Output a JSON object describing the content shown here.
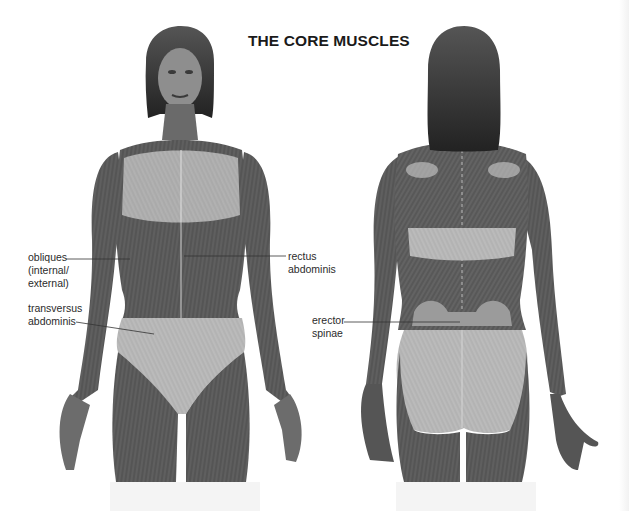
{
  "title": "THE CORE MUSCLES",
  "figures": {
    "front": {
      "view": "anterior",
      "description": "female figure, front view, superficial muscles overlay"
    },
    "back": {
      "view": "posterior",
      "description": "female figure, back view, superficial muscles overlay"
    }
  },
  "labels": {
    "obliques": {
      "lines": [
        "obliques",
        "(internal/",
        "external)"
      ]
    },
    "transversus": {
      "lines": [
        "transversus",
        "abdominis"
      ]
    },
    "rectus": {
      "lines": [
        "rectus",
        "abdominis"
      ]
    },
    "erector": {
      "lines": [
        "erector",
        "spinae"
      ]
    }
  },
  "colors": {
    "background": "#ffffff",
    "muscle": "#5a5a5a",
    "muscle_dark": "#444444",
    "highlight_region": "#b4b4b4",
    "fiber_lines": "#d8d8d8",
    "hair": "#2e2e2e",
    "skin": "#8a8a8a",
    "text": "#2b2b2b"
  }
}
